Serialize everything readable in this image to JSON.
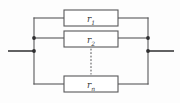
{
  "diagram": {
    "type": "parallel-resistor-network",
    "background_color": "#fdfdfd",
    "line_color": "#58585a",
    "lead_color": "#3a3a3c",
    "node_color": "#2f2f31",
    "left_bus_x": 34,
    "right_bus_x": 148,
    "terminal_y": 51,
    "branches": [
      {
        "id": "branch-1",
        "label_base": "r",
        "label_sub": "1",
        "y": 18,
        "box": {
          "x": 64,
          "y": 10,
          "width": 54,
          "height": 16
        }
      },
      {
        "id": "branch-2",
        "label_base": "r",
        "label_sub": "2",
        "y": 38,
        "box": {
          "x": 64,
          "y": 31,
          "width": 54,
          "height": 16
        }
      },
      {
        "id": "branch-n",
        "label_base": "r",
        "label_sub": "n",
        "y": 84,
        "box": {
          "x": 64,
          "y": 76,
          "width": 54,
          "height": 16
        }
      }
    ],
    "ellipsis": {
      "label": "vertical-dots-continuation",
      "x": 91,
      "y_start": 49,
      "y_end": 74
    },
    "nodes": [
      {
        "name": "left-node-branch2",
        "x": 34,
        "y": 38
      },
      {
        "name": "left-node-terminal",
        "x": 34,
        "y": 51
      },
      {
        "name": "right-node-branch2",
        "x": 148,
        "y": 38
      },
      {
        "name": "right-node-terminal",
        "x": 148,
        "y": 51
      }
    ],
    "leads": {
      "left": {
        "x1": 8,
        "x2": 34,
        "y": 51
      },
      "right": {
        "x1": 148,
        "x2": 174,
        "y": 51
      }
    }
  }
}
